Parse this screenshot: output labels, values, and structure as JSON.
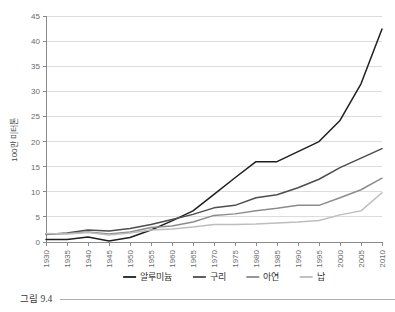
{
  "figure": {
    "caption": "그림 9.4",
    "caption_has_rule": true
  },
  "chart_data": {
    "type": "line",
    "title": "",
    "subtitle": "",
    "xlabel": "",
    "ylabel": "100만 미터톤",
    "xlim": [
      1930,
      2010
    ],
    "ylim": [
      0,
      45
    ],
    "ytick_step": 5,
    "grid": true,
    "grid_axis": "y",
    "legend_position": "bottom",
    "x": [
      1930,
      1935,
      1940,
      1945,
      1950,
      1955,
      1960,
      1965,
      1970,
      1975,
      1980,
      1985,
      1990,
      1995,
      2000,
      2005,
      2010
    ],
    "xtick_labels": [
      "1930",
      "1935",
      "1940",
      "1945",
      "1950",
      "1955",
      "1960",
      "1965",
      "1970",
      "1975",
      "1980",
      "1985",
      "1990",
      "1995",
      "2000",
      "2005",
      "2010"
    ],
    "ytick_labels": [
      "0",
      "5",
      "10",
      "15",
      "20",
      "25",
      "30",
      "35",
      "40",
      "45"
    ],
    "series": [
      {
        "name": "알루미늄",
        "color": "#1f1f1f",
        "width": 1.7,
        "values": [
          0.5,
          0.5,
          1.0,
          0.2,
          0.9,
          2.4,
          4.2,
          6.2,
          9.5,
          12.8,
          16.0,
          16.0,
          18.0,
          20.0,
          24.2,
          31.5,
          42.4
        ]
      },
      {
        "name": "구리",
        "color": "#4d4d4d",
        "width": 1.6,
        "values": [
          1.5,
          1.8,
          2.4,
          2.2,
          2.7,
          3.5,
          4.5,
          5.5,
          6.8,
          7.3,
          8.8,
          9.4,
          10.8,
          12.5,
          14.8,
          16.7,
          18.6
        ]
      },
      {
        "name": "아연",
        "color": "#8c8c8c",
        "width": 1.6,
        "values": [
          1.6,
          1.7,
          2.0,
          1.6,
          2.0,
          2.9,
          3.2,
          4.0,
          5.3,
          5.6,
          6.2,
          6.7,
          7.3,
          7.3,
          8.8,
          10.4,
          12.7
        ]
      },
      {
        "name": "납",
        "color": "#bdbdbd",
        "width": 1.6,
        "values": [
          1.7,
          1.6,
          1.9,
          1.4,
          1.8,
          2.4,
          2.6,
          3.0,
          3.5,
          3.5,
          3.6,
          3.8,
          4.0,
          4.3,
          5.4,
          6.2,
          9.8
        ]
      }
    ]
  },
  "legend": {
    "items": [
      {
        "label": "알루미늄",
        "color": "#1f1f1f"
      },
      {
        "label": "구리",
        "color": "#4d4d4d"
      },
      {
        "label": "아연",
        "color": "#8c8c8c"
      },
      {
        "label": "납",
        "color": "#bdbdbd"
      }
    ]
  }
}
